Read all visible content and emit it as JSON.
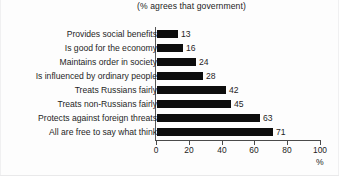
{
  "chart_data": {
    "type": "bar",
    "orientation": "horizontal",
    "title": "(% agrees that government)",
    "xlabel": "%",
    "ylabel": "",
    "categories": [
      "Provides social benefits",
      "Is good for the economy",
      "Maintains order in society",
      "Is influenced by ordinary people",
      "Treats Russians fairly",
      "Treats non-Russians fairly",
      "Protects against foreign threats",
      "All are free to say what think"
    ],
    "values": [
      13,
      16,
      24,
      28,
      42,
      45,
      63,
      71
    ],
    "value_labels": [
      "13",
      "16",
      "24",
      "28",
      "42",
      "45",
      "63",
      "71"
    ],
    "xlim": [
      0,
      100
    ],
    "xticks": [
      0,
      20,
      40,
      60,
      80,
      100
    ],
    "xtick_labels": [
      "0",
      "20",
      "40",
      "60",
      "80",
      "100"
    ],
    "grid": false,
    "legend": false,
    "bar_color": "#0d0d0d",
    "background_color": "#fdfdfd",
    "axis_color": "#4b4b4b"
  }
}
